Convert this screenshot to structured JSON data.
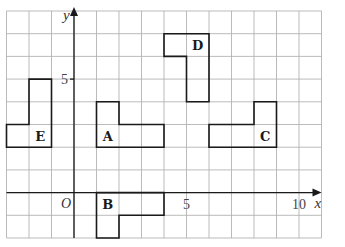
{
  "diagram": {
    "title": "",
    "grid": {
      "x_min": -3,
      "x_max": 11,
      "y_min": -2,
      "y_max": 8,
      "origin_px": [
        74,
        192.6
      ],
      "unit_px": [
        22.5,
        22.7
      ],
      "line_color": "#b3b3b3"
    },
    "axes": {
      "x_label": "x",
      "y_label": "y",
      "origin_label": "O",
      "x_ticks": [
        {
          "value": 5,
          "label": "5"
        },
        {
          "value": 10,
          "label": "10"
        }
      ],
      "y_ticks": [
        {
          "value": 5,
          "label": "5"
        }
      ],
      "color": "#1a1a1a"
    },
    "shapes": [
      {
        "name": "A",
        "label": "A",
        "label_pos": [
          1.5,
          2.5
        ],
        "vertices": [
          [
            1,
            2
          ],
          [
            4,
            2
          ],
          [
            4,
            3
          ],
          [
            2,
            3
          ],
          [
            2,
            4
          ],
          [
            1,
            4
          ]
        ]
      },
      {
        "name": "B",
        "label": "B",
        "label_pos": [
          1.5,
          -0.5
        ],
        "vertices": [
          [
            1,
            0
          ],
          [
            4,
            0
          ],
          [
            4,
            -1
          ],
          [
            2,
            -1
          ],
          [
            2,
            -2
          ],
          [
            1,
            -2
          ]
        ]
      },
      {
        "name": "C",
        "label": "C",
        "label_pos": [
          8.5,
          2.5
        ],
        "vertices": [
          [
            6,
            2
          ],
          [
            9,
            2
          ],
          [
            9,
            4
          ],
          [
            8,
            4
          ],
          [
            8,
            3
          ],
          [
            6,
            3
          ]
        ]
      },
      {
        "name": "D",
        "label": "D",
        "label_pos": [
          5.5,
          6.5
        ],
        "vertices": [
          [
            4,
            7
          ],
          [
            6,
            7
          ],
          [
            6,
            4
          ],
          [
            5,
            4
          ],
          [
            5,
            6
          ],
          [
            4,
            6
          ]
        ]
      },
      {
        "name": "E",
        "label": "E",
        "label_pos": [
          -1.5,
          2.5
        ],
        "vertices": [
          [
            -3,
            2
          ],
          [
            -1,
            2
          ],
          [
            -1,
            5
          ],
          [
            -2,
            5
          ],
          [
            -2,
            3
          ],
          [
            -3,
            3
          ]
        ]
      }
    ]
  }
}
